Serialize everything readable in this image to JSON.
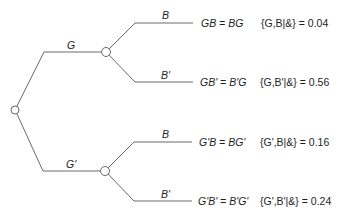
{
  "diagram": {
    "type": "probability-tree",
    "root": {
      "id": "root"
    },
    "level1": [
      {
        "id": "G",
        "label": "G"
      },
      {
        "id": "Gp",
        "label": "G'"
      }
    ],
    "leaves": [
      {
        "branch_label": "B",
        "joint": "GB = BG",
        "probability_label": "{G,B|&} = 0.04"
      },
      {
        "branch_label": "B'",
        "joint": "GB' = B'G",
        "probability_label": "{G,B'|&} = 0.56"
      },
      {
        "branch_label": "B",
        "joint": "G'B = BG'",
        "probability_label": "{G',B|&} = 0.16"
      },
      {
        "branch_label": "B'",
        "joint": "G'B' = B'G'",
        "probability_label": "{G',B'|&} = 0.24"
      }
    ],
    "colors": {
      "line": "#6a6a6a",
      "node_fill": "#ffffff",
      "text": "#1e1e1e"
    }
  }
}
